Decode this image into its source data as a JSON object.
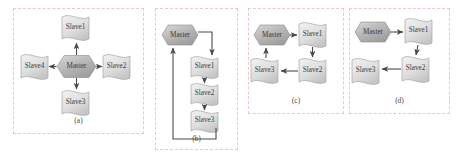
{
  "figure": {
    "background_color": "#ffffff",
    "panel_border_color": "#e8c9c4",
    "node_stroke_color": "#8a8a8a",
    "arrow_color": "#4a4a4a",
    "master_fill": "#b9b9b9",
    "slave_fill": "#e2e2e2"
  },
  "panels": [
    {
      "id": "a",
      "caption": "(a)",
      "topology": "star",
      "nodes": [
        {
          "name": "Master",
          "type": "hexagon",
          "role": "master"
        },
        {
          "name": "Slave1",
          "type": "flag",
          "role": "slave"
        },
        {
          "name": "Slave2",
          "type": "flag",
          "role": "slave"
        },
        {
          "name": "Slave3",
          "type": "flag",
          "role": "slave"
        },
        {
          "name": "Slave4",
          "type": "flag",
          "role": "slave"
        }
      ],
      "edges": [
        {
          "from": "Master",
          "to": "Slave1"
        },
        {
          "from": "Master",
          "to": "Slave2"
        },
        {
          "from": "Master",
          "to": "Slave3"
        },
        {
          "from": "Master",
          "to": "Slave4"
        }
      ]
    },
    {
      "id": "b",
      "caption": "(b)",
      "topology": "ring",
      "nodes": [
        {
          "name": "Master",
          "type": "hexagon",
          "role": "master"
        },
        {
          "name": "Slave1",
          "type": "flag",
          "role": "slave"
        },
        {
          "name": "Slave2",
          "type": "flag",
          "role": "slave"
        },
        {
          "name": "Slave3",
          "type": "flag",
          "role": "slave"
        }
      ],
      "edges": [
        {
          "from": "Master",
          "to": "Slave1"
        },
        {
          "from": "Slave1",
          "to": "Slave2"
        },
        {
          "from": "Slave2",
          "to": "Slave3"
        },
        {
          "from": "Slave3",
          "to": "Master"
        }
      ]
    },
    {
      "id": "c",
      "caption": "(c)",
      "topology": "ring",
      "nodes": [
        {
          "name": "Master",
          "type": "hexagon",
          "role": "master"
        },
        {
          "name": "Slave1",
          "type": "flag",
          "role": "slave"
        },
        {
          "name": "Slave2",
          "type": "flag",
          "role": "slave"
        },
        {
          "name": "Slave3",
          "type": "flag",
          "role": "slave"
        }
      ],
      "edges": [
        {
          "from": "Master",
          "to": "Slave1"
        },
        {
          "from": "Slave1",
          "to": "Slave2"
        },
        {
          "from": "Slave2",
          "to": "Slave3"
        },
        {
          "from": "Slave3",
          "to": "Master"
        }
      ]
    },
    {
      "id": "d",
      "caption": "(d)",
      "topology": "chain",
      "nodes": [
        {
          "name": "Master",
          "type": "hexagon",
          "role": "master"
        },
        {
          "name": "Slave1",
          "type": "flag",
          "role": "slave"
        },
        {
          "name": "Slave2",
          "type": "flag",
          "role": "slave"
        },
        {
          "name": "Slave3",
          "type": "flag",
          "role": "slave"
        }
      ],
      "edges": [
        {
          "from": "Master",
          "to": "Slave1"
        },
        {
          "from": "Slave1",
          "to": "Slave2"
        },
        {
          "from": "Slave2",
          "to": "Slave3"
        }
      ]
    }
  ]
}
